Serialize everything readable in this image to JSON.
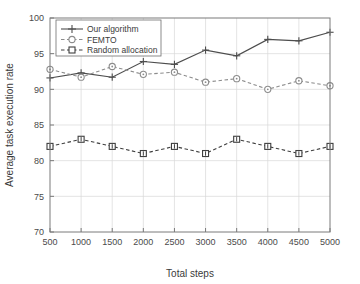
{
  "chart_data": {
    "type": "line",
    "title": "",
    "xlabel": "Total steps",
    "ylabel": "Average task execution rate",
    "x": [
      500,
      1000,
      1500,
      2000,
      2500,
      3000,
      3500,
      4000,
      4500,
      5000
    ],
    "categories": [
      "500",
      "1000",
      "1500",
      "2000",
      "2500",
      "3000",
      "3500",
      "4000",
      "4500",
      "5000"
    ],
    "xlim": [
      500,
      5000
    ],
    "ylim": [
      70,
      100
    ],
    "xticks": [
      500,
      1000,
      1500,
      2000,
      2500,
      3000,
      3500,
      4000,
      4500,
      5000
    ],
    "yticks": [
      70,
      75,
      80,
      85,
      90,
      95,
      100
    ],
    "xtick_labels": [
      "500",
      "1000",
      "1500",
      "2000",
      "2500",
      "3000",
      "3500",
      "4000",
      "4500",
      "5000"
    ],
    "ytick_labels": [
      "70",
      "75",
      "80",
      "85",
      "90",
      "95",
      "100"
    ],
    "grid": true,
    "legend_position": "upper left",
    "series": [
      {
        "name": "Our algorithm",
        "values": [
          91.6,
          92.3,
          91.7,
          93.9,
          93.5,
          95.5,
          94.7,
          97.0,
          96.8,
          98.0
        ],
        "line_style": "solid",
        "marker": "plus",
        "color": "#4d4d4d"
      },
      {
        "name": "FEMTO",
        "values": [
          92.8,
          91.7,
          93.2,
          92.1,
          92.4,
          91.0,
          91.5,
          90.0,
          91.2,
          90.5
        ],
        "line_style": "dashed",
        "marker": "circle",
        "color": "#8c8c8c"
      },
      {
        "name": "Random allocation",
        "values": [
          82.0,
          83.0,
          82.0,
          81.0,
          82.0,
          81.0,
          83.0,
          82.0,
          81.0,
          82.0
        ],
        "line_style": "dashed",
        "marker": "square",
        "color": "#3f3f3f"
      }
    ]
  },
  "legend": {
    "items": [
      {
        "label": "Our algorithm"
      },
      {
        "label": "FEMTO"
      },
      {
        "label": "Random allocation"
      }
    ]
  },
  "axes": {
    "x_title": "Total steps",
    "y_title": "Average task execution rate"
  }
}
